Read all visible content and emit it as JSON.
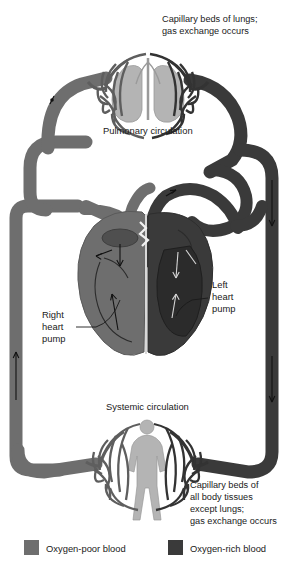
{
  "figure": {
    "background_color": "#ffffff"
  },
  "colors": {
    "oxygen_poor": "#6e6e6e",
    "oxygen_poor_dark_edge": "#5e5e5e",
    "oxygen_rich": "#3a3a3a",
    "oxygen_rich_edge": "#2e2e2e",
    "organ_silhouette": "#b4b4b4",
    "organ_outline": "#8d8d8d",
    "text": "#1a1a1a",
    "leader_line": "#1a1a1a"
  },
  "captions": {
    "lungs": {
      "lines": [
        "Capillary beds of lungs;",
        "gas exchange occurs"
      ]
    },
    "body": {
      "lines": [
        "Capillary beds of",
        "all body tissues",
        "except lungs;",
        "gas exchange occurs"
      ]
    },
    "pulmonary_circulation": "Pulmonary circulation",
    "systemic_circulation": "Systemic circulation"
  },
  "labels": {
    "right_heart_pump": {
      "lines": [
        "Right",
        "heart",
        "pump"
      ]
    },
    "left_heart_pump": {
      "lines": [
        "Left",
        "heart",
        "pump"
      ]
    }
  },
  "legend": {
    "items": [
      {
        "label": "Oxygen-poor blood",
        "swatch_color": "#6e6e6e"
      },
      {
        "label": "Oxygen-rich blood",
        "swatch_color": "#3a3a3a"
      }
    ]
  },
  "structures": {
    "lung_capillary_bed": "lung-capillary-bed",
    "body_capillary_bed": "body-capillary-bed",
    "lungs_silhouette": "lungs-silhouette",
    "body_silhouette": "human-body-silhouette",
    "heart": "heart-cross-section",
    "right_heart": "right-heart-chambers",
    "left_heart": "left-heart-chambers"
  }
}
